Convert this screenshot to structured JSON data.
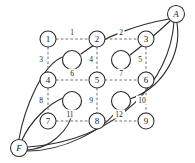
{
  "diagram": {
    "terminals": [
      {
        "id": "A",
        "label": "A",
        "x": 176,
        "y": 14
      },
      {
        "id": "F",
        "label": "F",
        "x": 19,
        "y": 148
      }
    ],
    "grid_nodes": [
      {
        "id": "n1",
        "label": "1",
        "x": 48,
        "y": 39,
        "r": 8
      },
      {
        "id": "n2",
        "label": "2",
        "x": 97,
        "y": 39,
        "r": 8
      },
      {
        "id": "n3",
        "label": "3",
        "x": 146,
        "y": 39,
        "r": 8
      },
      {
        "id": "n4",
        "label": "4",
        "x": 48,
        "y": 80,
        "r": 8
      },
      {
        "id": "n5",
        "label": "5",
        "x": 97,
        "y": 80,
        "r": 8
      },
      {
        "id": "n6",
        "label": "6",
        "x": 146,
        "y": 80,
        "r": 8
      },
      {
        "id": "n7",
        "label": "7",
        "x": 48,
        "y": 121,
        "r": 8
      },
      {
        "id": "n8",
        "label": "8",
        "x": 97,
        "y": 121,
        "r": 8
      },
      {
        "id": "n9",
        "label": "9",
        "x": 146,
        "y": 121,
        "r": 8
      }
    ],
    "junction_nodes": [
      {
        "id": "j1",
        "label": "",
        "x": 72,
        "y": 60,
        "r": 9.5
      },
      {
        "id": "j2",
        "label": "",
        "x": 121,
        "y": 60,
        "r": 9.5
      },
      {
        "id": "j3",
        "label": "",
        "x": 72,
        "y": 101,
        "r": 9.5
      },
      {
        "id": "j4",
        "label": "",
        "x": 121,
        "y": 101,
        "r": 9.5
      }
    ],
    "dashed_edges": [
      {
        "id": "e1",
        "label": "1",
        "from": "n1",
        "to": "n2",
        "lx": 72,
        "ly": 32,
        "x1": 56,
        "y1": 39,
        "x2": 89,
        "y2": 39
      },
      {
        "id": "e2",
        "label": "2",
        "from": "n2",
        "to": "n3",
        "lx": 121,
        "ly": 32,
        "x1": 105,
        "y1": 39,
        "x2": 138,
        "y2": 39
      },
      {
        "id": "e3",
        "label": "3",
        "from": "n1",
        "to": "n4",
        "lx": 41,
        "ly": 59,
        "x1": 48,
        "y1": 47,
        "x2": 48,
        "y2": 72
      },
      {
        "id": "e4",
        "label": "4",
        "from": "n2",
        "to": "n5",
        "lx": 91,
        "ly": 59,
        "x1": 97,
        "y1": 47,
        "x2": 97,
        "y2": 72
      },
      {
        "id": "e5",
        "label": "5",
        "from": "n3",
        "to": "n6",
        "lx": 140,
        "ly": 59,
        "x1": 146,
        "y1": 47,
        "x2": 146,
        "y2": 72
      },
      {
        "id": "e6",
        "label": "6",
        "from": "n4",
        "to": "n5",
        "lx": 72,
        "ly": 73,
        "x1": 56,
        "y1": 80,
        "x2": 89,
        "y2": 80
      },
      {
        "id": "e7",
        "label": "7",
        "from": "n5",
        "to": "n6",
        "lx": 121,
        "ly": 73,
        "x1": 105,
        "y1": 80,
        "x2": 138,
        "y2": 80
      },
      {
        "id": "e8",
        "label": "8",
        "from": "n4",
        "to": "n7",
        "lx": 41,
        "ly": 100,
        "x1": 48,
        "y1": 88,
        "x2": 48,
        "y2": 113
      },
      {
        "id": "e9",
        "label": "9",
        "from": "n5",
        "to": "n8",
        "lx": 91,
        "ly": 100,
        "x1": 97,
        "y1": 88,
        "x2": 97,
        "y2": 113
      },
      {
        "id": "e10",
        "label": "10",
        "from": "n6",
        "to": "n9",
        "lx": 142,
        "ly": 100,
        "x1": 146,
        "y1": 88,
        "x2": 146,
        "y2": 113
      },
      {
        "id": "e11",
        "label": "11",
        "from": "n7",
        "to": "n8",
        "lx": 70,
        "ly": 114,
        "x1": 56,
        "y1": 121,
        "x2": 89,
        "y2": 121
      },
      {
        "id": "e12",
        "label": "12",
        "from": "n8",
        "to": "n9",
        "lx": 119,
        "ly": 114,
        "x1": 105,
        "y1": 121,
        "x2": 138,
        "y2": 121
      }
    ],
    "solid_edges": [
      {
        "id": "s1",
        "from": "A",
        "to": "j1",
        "path": "M 169 19 C 140 24 104 36 81 54"
      },
      {
        "id": "s2",
        "from": "A",
        "to": "j2",
        "path": "M 170 21 C 156 34 142 46 130 55"
      },
      {
        "id": "s3",
        "from": "A",
        "to": "j4",
        "path": "M 177 23 C 182 55 162 88 130 99"
      },
      {
        "id": "s4",
        "from": "A",
        "to": "F",
        "path": "M 174 22 C 170 80 120 140 28 147"
      },
      {
        "id": "s5",
        "from": "j1",
        "to": "F",
        "path": "M 63 57 C 42 64 24 110 19 139"
      },
      {
        "id": "s6",
        "from": "j3",
        "to": "F",
        "path": "M 63 98 C 48 104 30 122 22 140"
      },
      {
        "id": "s7",
        "from": "F",
        "to": "j4",
        "path": "M 25 151 C 62 152 104 130 117 110"
      },
      {
        "id": "s8",
        "from": "F",
        "to": "j3",
        "path": "M 24 150 C 52 150 70 128 73 111"
      }
    ]
  }
}
